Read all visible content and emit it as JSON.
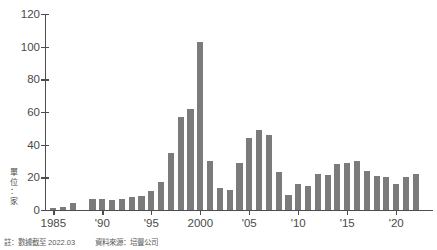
{
  "unit_label": "單\n位\n：\n家",
  "footnotes": {
    "note": "註：數據截至 2022.03",
    "source": "資料來源：培豐公司"
  },
  "colors": {
    "bar": "#7b7b7b",
    "axis": "#4d4d4d",
    "text": "#4a4a4a",
    "background": "#ffffff"
  },
  "chart_data": {
    "type": "bar",
    "title": "",
    "subtitle": "",
    "xlabel": "",
    "ylabel": "單位：家",
    "ylim": [
      0,
      120
    ],
    "yticks": [
      0,
      20,
      40,
      60,
      80,
      100,
      120
    ],
    "ytick_labels": [
      "0",
      "20",
      "40",
      "60",
      "80",
      "100",
      "120"
    ],
    "xtick_labels": [
      "1985",
      "'90",
      "'95",
      "2000",
      "'05",
      "'10",
      "'15",
      "'20"
    ],
    "xtick_years": [
      1985,
      1990,
      1995,
      2000,
      2005,
      2010,
      2015,
      2020
    ],
    "grid": false,
    "legend": false,
    "categories": [
      "1985",
      "1986",
      "1987",
      "1988",
      "1989",
      "1990",
      "1991",
      "1992",
      "1993",
      "1994",
      "1995",
      "1996",
      "1997",
      "1998",
      "1999",
      "2000",
      "2001",
      "2002",
      "2003",
      "2004",
      "2005",
      "2006",
      "2007",
      "2008",
      "2009",
      "2010",
      "2011",
      "2012",
      "2013",
      "2014",
      "2015",
      "2016",
      "2017",
      "2018",
      "2019",
      "2020",
      "2021",
      "2022"
    ],
    "values": [
      1,
      2,
      4,
      0,
      7,
      7,
      6,
      6.5,
      8,
      8.5,
      11.5,
      17,
      35,
      57,
      62,
      103,
      30,
      13.5,
      12.5,
      29,
      44,
      49,
      46,
      23,
      9,
      16,
      15,
      22,
      21.5,
      28,
      29,
      30,
      24,
      21,
      20,
      16,
      20,
      22
    ],
    "peak": {
      "year": "2000",
      "value": 103
    },
    "bar_count": 38
  }
}
